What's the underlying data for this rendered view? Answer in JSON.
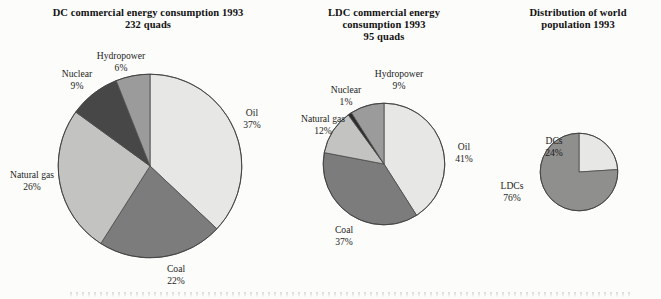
{
  "figure": {
    "background": "#fcfcfa",
    "caption_clipped": ""
  },
  "charts": [
    {
      "id": "dc-energy",
      "title_line1": "DC commercial energy consumption 1993",
      "title_line2": "232 quads"
    },
    {
      "id": "ldc-energy",
      "title_line1": "LDC commercial energy",
      "title_line2": "consumption 1993",
      "title_line3": "95 quads"
    },
    {
      "id": "world-population",
      "title_line1": "Distribution of world",
      "title_line2": "population 1993"
    }
  ],
  "chart_data": [
    {
      "type": "pie",
      "title": "DC commercial energy consumption 1993 232 quads",
      "total_label": "232 quads",
      "start_angle_deg": 0,
      "direction": "clockwise",
      "categories": [
        "Oil",
        "Coal",
        "Natural gas",
        "Nuclear",
        "Hydropower"
      ],
      "values": [
        37,
        22,
        26,
        9,
        6
      ],
      "value_labels": [
        "37%",
        "22%",
        "26%",
        "9%",
        "6%"
      ],
      "colors": [
        "#e7e7e5",
        "#7c7c7c",
        "#c3c3c1",
        "#474747",
        "#9b9b9b"
      ],
      "units": "percent"
    },
    {
      "type": "pie",
      "title": "LDC commercial energy consumption 1993 95 quads",
      "total_label": "95 quads",
      "start_angle_deg": 0,
      "direction": "clockwise",
      "categories": [
        "Oil",
        "Coal",
        "Natural gas",
        "Nuclear",
        "Hydropower"
      ],
      "values": [
        41,
        37,
        12,
        1,
        9
      ],
      "value_labels": [
        "41%",
        "37%",
        "12%",
        "1%",
        "9%"
      ],
      "colors": [
        "#e7e7e5",
        "#7c7c7c",
        "#c3c3c1",
        "#2c2c2c",
        "#9b9b9b"
      ],
      "units": "percent"
    },
    {
      "type": "pie",
      "title": "Distribution of world population 1993",
      "start_angle_deg": 0,
      "direction": "clockwise",
      "categories": [
        "DCs",
        "LDCs"
      ],
      "values": [
        24,
        76
      ],
      "value_labels": [
        "24%",
        "76%"
      ],
      "colors": [
        "#e7e7e5",
        "#8f8f8d"
      ],
      "units": "percent"
    }
  ]
}
